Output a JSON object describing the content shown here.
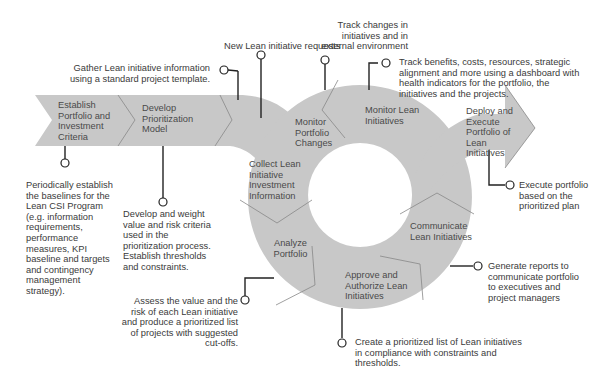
{
  "diagram": {
    "colors": {
      "band": "#c8c8c8",
      "connector": "#222222",
      "text": "#3a3a3a"
    },
    "stages": [
      {
        "id": "establish",
        "label": "Establish Portfolio and Investment Criteria"
      },
      {
        "id": "develop",
        "label": "Develop Prioritization Model"
      },
      {
        "id": "collect",
        "label": "Collect Lean Initiative Investment Information"
      },
      {
        "id": "analyze",
        "label": "Analyze Portfolio"
      },
      {
        "id": "approve",
        "label": "Approve and Authorize  Lean Initiatives"
      },
      {
        "id": "communicate",
        "label": "Communicate Lean Initiatives"
      },
      {
        "id": "monitor-lean",
        "label": "Monitor Lean Initiatives"
      },
      {
        "id": "monitor-portfolio",
        "label": "Monitor Portfolio Changes"
      },
      {
        "id": "deploy",
        "label": "Deploy and Execute Portfolio of Lean Initiatives"
      }
    ],
    "annotations": {
      "establish": "Periodically establish the baselines for the Lean CSI Program (e.g. information requirements, performance measures, KPI baseline and targets and contingency management strategy).",
      "develop": "Develop and weight value and risk criteria used in the prioritization process. Establish thresholds and constraints.",
      "gather": "Gather Lean initiative information using a standard project template.",
      "new_requests": "New Lean initiative requests",
      "track_changes": "Track changes in initiatives and in external environment",
      "track_benefits": "Track benefits, costs, resources, strategic alignment and more using a dashboard with health indicators for the portfolio, the initiatives and the projects.",
      "execute": "Execute portfolio based on the prioritized plan",
      "generate_reports": "Generate reports to communicate portfolio to executives and project managers",
      "create_list": "Create a prioritized list of Lean initiatives in compliance with constraints and thresholds.",
      "assess": "Assess the value and the risk of each Lean initiative and produce a prioritized list of projects with suggested cut-offs."
    }
  }
}
